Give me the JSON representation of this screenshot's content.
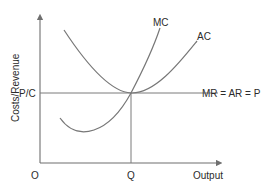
{
  "diagram": {
    "y_axis_label": "Costs/Revenue",
    "x_axis_label": "Output",
    "origin_label": "O",
    "price_label": "P/C",
    "quantity_label": "Q",
    "curves": [
      {
        "id": "mc",
        "label": "MC",
        "type": "marginal cost"
      },
      {
        "id": "ac",
        "label": "AC",
        "type": "average cost"
      },
      {
        "id": "mr",
        "label": "MR = AR = P",
        "type": "horizontal revenue line"
      }
    ],
    "colors": {
      "lines": "#777777",
      "text": "#2b2b2b",
      "background": "#ffffff"
    }
  }
}
